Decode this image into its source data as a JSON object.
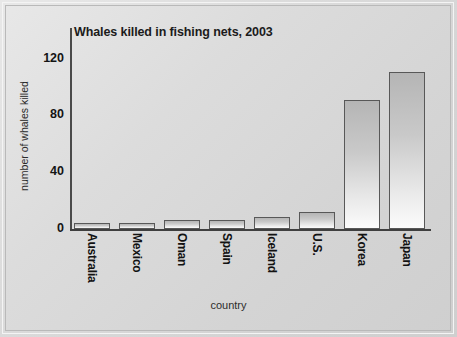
{
  "chart_data": {
    "type": "bar",
    "title": "Whales killed in fishing nets, 2003",
    "xlabel": "country",
    "ylabel": "number of whales killed",
    "categories": [
      "Australia",
      "Mexico",
      "Oman",
      "Spain",
      "Iceland",
      "U.S.",
      "Korea",
      "Japan"
    ],
    "values": [
      4,
      4,
      6,
      6,
      8,
      12,
      89,
      108
    ],
    "ylim": [
      0,
      120
    ],
    "yticks": [
      0,
      40,
      80,
      120
    ],
    "ytick_labels": [
      "0",
      "40",
      "80",
      "120"
    ],
    "grid": false,
    "legend": null,
    "series": [
      {
        "name": "number of whales killed",
        "values": [
          4,
          4,
          6,
          6,
          8,
          12,
          89,
          108
        ]
      }
    ]
  },
  "colors": {
    "background": "#dcdcdc",
    "bar_fill_top": "#b5b5b5",
    "bar_fill_bottom": "#fbfbfb",
    "bar_border": "#585858",
    "axis": "#3f3f3f",
    "text": "#141414"
  }
}
